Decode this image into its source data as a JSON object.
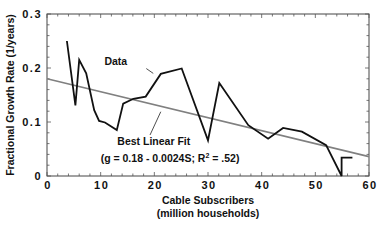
{
  "chart_data": {
    "type": "line",
    "title": "",
    "xlabel": "Cable Subscribers",
    "xlabel_line2": "(million households)",
    "ylabel": "Fractional Growth Rate (1/years)",
    "xlim": [
      0,
      60
    ],
    "ylim": [
      0,
      0.3
    ],
    "x_ticks": [
      0,
      10,
      20,
      30,
      40,
      50,
      60
    ],
    "x_tick_labels": [
      "0",
      "10",
      "20",
      "30",
      "40",
      "50",
      "60"
    ],
    "y_ticks": [
      0,
      0.1,
      0.2,
      0.3
    ],
    "y_tick_labels": [
      "0",
      "0.1",
      "0.2",
      "0.3"
    ],
    "x_minor_step": 2,
    "y_minor_step": 0.02,
    "grid": false,
    "legend": "none (inline annotations)",
    "series": [
      {
        "name": "Data",
        "color": "#111111",
        "points": [
          [
            3.7,
            0.25
          ],
          [
            5.3,
            0.131
          ],
          [
            6.0,
            0.215
          ],
          [
            7.3,
            0.19
          ],
          [
            8.8,
            0.122
          ],
          [
            9.7,
            0.102
          ],
          [
            10.8,
            0.099
          ],
          [
            13.0,
            0.085
          ],
          [
            14.2,
            0.134
          ],
          [
            16.1,
            0.143
          ],
          [
            18.4,
            0.147
          ],
          [
            21.2,
            0.189
          ],
          [
            25.1,
            0.199
          ],
          [
            30.0,
            0.066
          ],
          [
            32.1,
            0.172
          ],
          [
            37.5,
            0.094
          ],
          [
            41.2,
            0.069
          ],
          [
            44.0,
            0.089
          ],
          [
            47.5,
            0.082
          ],
          [
            52.0,
            0.057
          ],
          [
            54.9,
            0.0
          ],
          [
            54.9,
            0.034
          ],
          [
            56.9,
            0.034
          ]
        ]
      },
      {
        "name": "Best Linear Fit",
        "color": "#808080",
        "equation": "g = 0.18 - 0.0024S",
        "intercept": 0.18,
        "slope": -0.0024,
        "r_squared": 0.52,
        "points": [
          [
            0,
            0.18
          ],
          [
            60,
            0.036
          ]
        ]
      }
    ],
    "annotations": [
      {
        "text": "Data",
        "x": 10.7,
        "y": 0.205,
        "leader_from": [
          18.5,
          0.199
        ],
        "leader_to": [
          19.8,
          0.19
        ]
      },
      {
        "text": "Best Linear Fit",
        "x": 13.1,
        "y": 0.058,
        "leader_from": [
          21.2,
          0.119
        ],
        "leader_to": [
          19.2,
          0.076
        ]
      },
      {
        "text": "(g = 0.18 - 0.0024S;  R",
        "sup": "2",
        "text_after": " = .52)",
        "x": 10.0,
        "y": 0.026
      }
    ]
  },
  "labels": {
    "xlabel1": "Cable Subscribers",
    "xlabel2": "(million households)",
    "ylabel": "Fractional Growth Rate (1/years)",
    "data_annot": "Data",
    "fit_annot": "Best Linear Fit",
    "eq_pre": "(g = 0.18 - 0.0024S;  R",
    "eq_sup": "2",
    "eq_post": " = .52)"
  },
  "colors": {
    "data_line": "#111111",
    "fit_line": "#808080",
    "axis": "#333333",
    "background": "#ffffff"
  }
}
